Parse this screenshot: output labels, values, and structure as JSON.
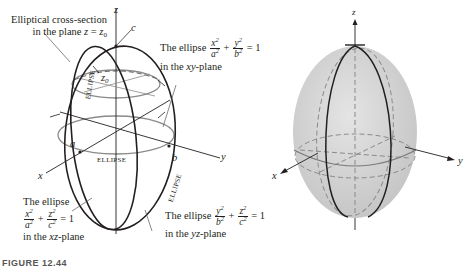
{
  "figure": {
    "left_diagram": {
      "axes": {
        "x": "x",
        "y": "y",
        "z": "z"
      },
      "intercepts": {
        "a": "a",
        "b": "b",
        "c": "c",
        "z0": "z0"
      },
      "curve_labels": [
        "ELLIPSE",
        "ELLIPSE",
        "ELLIPSE"
      ],
      "annotations": {
        "cross_section": {
          "line1": "Elliptical cross-section",
          "line2_prefix": "in the plane ",
          "line2_var": "z",
          "line2_eq": " = ",
          "line2_rhs": "z",
          "line2_rhs_sub": "0"
        },
        "xy_ellipse": {
          "prefix": "The ellipse",
          "num1": "x",
          "den1": "a",
          "num2": "y",
          "den2": "b",
          "plus": "+",
          "rhs": "= 1",
          "plane_prefix": "in the ",
          "plane_var": "xy",
          "plane_suffix": "-plane"
        },
        "xz_ellipse": {
          "prefix": "The ellipse",
          "num1": "x",
          "den1": "a",
          "num2": "z",
          "den2": "c",
          "plus": "+",
          "rhs": "= 1",
          "plane_prefix": "in the ",
          "plane_var": "xz",
          "plane_suffix": "-plane"
        },
        "yz_ellipse": {
          "prefix": "The ellipse",
          "num1": "y",
          "den1": "b",
          "num2": "z",
          "den2": "c",
          "plus": "+",
          "rhs": "= 1",
          "plane_prefix": "in the ",
          "plane_var": "yz",
          "plane_suffix": "-plane"
        },
        "exponent": "2"
      }
    },
    "right_diagram": {
      "axes": {
        "x": "x",
        "y": "y",
        "z": "z"
      },
      "surface_fill": "#d4d4d4"
    },
    "caption": "FIGURE 12.44"
  },
  "colors": {
    "ink": "#231f20",
    "gray_line": "#8a8a8a",
    "surface": "#d6d6d6"
  }
}
